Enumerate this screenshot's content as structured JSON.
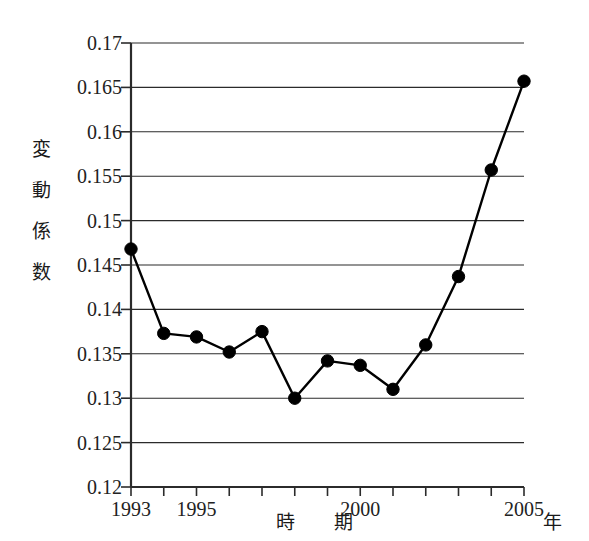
{
  "chart_data": {
    "type": "line",
    "title": "",
    "xlabel": "時　期",
    "xunit": "年",
    "ylabel": "変動係数",
    "ylabel_chars": [
      "変",
      "動",
      "係",
      "数"
    ],
    "x": [
      1993,
      1994,
      1995,
      1996,
      1997,
      1998,
      1999,
      2000,
      2001,
      2002,
      2003,
      2004,
      2005
    ],
    "values": [
      0.1468,
      0.1373,
      0.1369,
      0.1352,
      0.1375,
      0.13,
      0.1342,
      0.1337,
      0.131,
      0.136,
      0.1437,
      0.1557,
      0.1657
    ],
    "series": [
      {
        "name": "変動係数",
        "values": [
          0.1468,
          0.1373,
          0.1369,
          0.1352,
          0.1375,
          0.13,
          0.1342,
          0.1337,
          0.131,
          0.136,
          0.1437,
          0.1557,
          0.1657
        ]
      }
    ],
    "ylim": [
      0.12,
      0.17
    ],
    "xlim": [
      1993,
      2005
    ],
    "ytick_values": [
      0.12,
      0.125,
      0.13,
      0.135,
      0.14,
      0.145,
      0.15,
      0.155,
      0.16,
      0.165,
      0.17
    ],
    "ytick_labels": [
      "0.12",
      "0.125",
      "0.13",
      "0.135",
      "0.14",
      "0.145",
      "0.15",
      "0.155",
      "0.16",
      "0.165",
      "0.17"
    ],
    "xtick_values": [
      1993,
      1994,
      1995,
      1996,
      1997,
      1998,
      1999,
      2000,
      2001,
      2002,
      2003,
      2004,
      2005
    ],
    "xtick_labels": [
      {
        "value": 1993,
        "label": "1993"
      },
      {
        "value": 1995,
        "label": "1995"
      },
      {
        "value": 2000,
        "label": "2000"
      },
      {
        "value": 2005,
        "label": "2005"
      }
    ],
    "grid": true,
    "grid_axis": "y",
    "legend": false,
    "legend_position": "none",
    "line_color": "#000000",
    "marker_color": "#000000",
    "marker": "circle",
    "background_color": "#ffffff",
    "axis_color": "#2b2b2b"
  }
}
